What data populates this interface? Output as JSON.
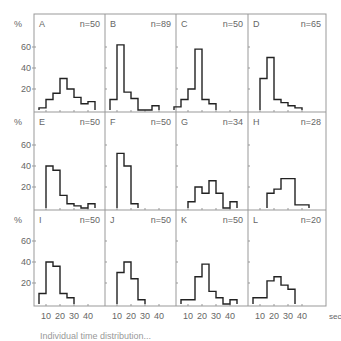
{
  "figure": {
    "y_unit_label": "%",
    "x_unit_label": "sec",
    "y_ticks": [
      20,
      40,
      60
    ],
    "x_ticks": [
      10,
      20,
      30,
      40
    ],
    "caption_partial": "Individual time distribution..."
  },
  "chart_data": [
    {
      "type": "bar",
      "panel": "A",
      "n_label": "n=50",
      "bin_start_sec": 5,
      "bin_width_sec": 5,
      "values": [
        2,
        10,
        16,
        30,
        20,
        12,
        6,
        8
      ],
      "ylabel": "%",
      "ylim": [
        0,
        75
      ],
      "xlim": [
        0,
        50
      ]
    },
    {
      "type": "bar",
      "panel": "B",
      "n_label": "n=89",
      "bin_start_sec": 5,
      "bin_width_sec": 5,
      "values": [
        10,
        62,
        17,
        11,
        0,
        0,
        4
      ],
      "ylabel": "%",
      "ylim": [
        0,
        75
      ],
      "xlim": [
        0,
        50
      ]
    },
    {
      "type": "bar",
      "panel": "C",
      "n_label": "n=50",
      "bin_start_sec": 0,
      "bin_width_sec": 5,
      "values": [
        3,
        10,
        20,
        58,
        10,
        6
      ],
      "ylabel": "%",
      "ylim": [
        0,
        75
      ],
      "xlim": [
        0,
        50
      ]
    },
    {
      "type": "bar",
      "panel": "D",
      "n_label": "n=65",
      "bin_start_sec": 10,
      "bin_width_sec": 5,
      "values": [
        30,
        50,
        10,
        7,
        4,
        2
      ],
      "ylabel": "%",
      "ylim": [
        0,
        75
      ],
      "xlim": [
        0,
        50
      ]
    },
    {
      "type": "bar",
      "panel": "E",
      "n_label": "n=50",
      "bin_start_sec": 10,
      "bin_width_sec": 5,
      "values": [
        40,
        36,
        12,
        4,
        2,
        0,
        4
      ],
      "ylabel": "%",
      "ylim": [
        0,
        75
      ],
      "xlim": [
        0,
        50
      ]
    },
    {
      "type": "bar",
      "panel": "F",
      "n_label": "n=50",
      "bin_start_sec": 10,
      "bin_width_sec": 5,
      "values": [
        52,
        40,
        4
      ],
      "ylabel": "%",
      "ylim": [
        0,
        75
      ],
      "xlim": [
        0,
        50
      ]
    },
    {
      "type": "bar",
      "panel": "G",
      "n_label": "n=34",
      "bin_start_sec": 10,
      "bin_width_sec": 5,
      "values": [
        6,
        20,
        14,
        26,
        14,
        0,
        6
      ],
      "ylabel": "%",
      "ylim": [
        0,
        75
      ],
      "xlim": [
        0,
        50
      ]
    },
    {
      "type": "bar",
      "panel": "H",
      "n_label": "n=28",
      "bin_start_sec": 15,
      "bin_width_sec": 5,
      "values": [
        14,
        18,
        28,
        28,
        3,
        3
      ],
      "ylabel": "%",
      "ylim": [
        0,
        75
      ],
      "xlim": [
        0,
        50
      ]
    },
    {
      "type": "bar",
      "panel": "I",
      "n_label": "n=50",
      "bin_start_sec": 5,
      "bin_width_sec": 5,
      "values": [
        10,
        40,
        36,
        10,
        6
      ],
      "ylabel": "%",
      "ylim": [
        0,
        75
      ],
      "xlim": [
        0,
        50
      ]
    },
    {
      "type": "bar",
      "panel": "J",
      "n_label": "n=50",
      "bin_start_sec": 10,
      "bin_width_sec": 5,
      "values": [
        30,
        40,
        24,
        4
      ],
      "ylabel": "%",
      "ylim": [
        0,
        75
      ],
      "xlim": [
        0,
        50
      ]
    },
    {
      "type": "bar",
      "panel": "K",
      "n_label": "n=50",
      "bin_start_sec": 5,
      "bin_width_sec": 5,
      "values": [
        4,
        4,
        26,
        38,
        12,
        6,
        0,
        4
      ],
      "ylabel": "%",
      "ylim": [
        0,
        75
      ],
      "xlim": [
        0,
        50
      ]
    },
    {
      "type": "bar",
      "panel": "L",
      "n_label": "n=20",
      "bin_start_sec": 5,
      "bin_width_sec": 5,
      "values": [
        6,
        6,
        22,
        26,
        18,
        14
      ],
      "ylabel": "%",
      "ylim": [
        0,
        75
      ],
      "xlim": [
        0,
        50
      ]
    }
  ]
}
